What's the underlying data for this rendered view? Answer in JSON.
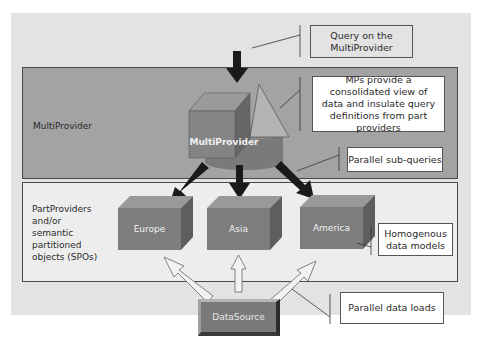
{
  "diagram": {
    "layers": {
      "multiprovider_layer_label": "MultiProvider",
      "partprovider_layer_label": "PartProviders\nand/or\nsemantic\npartitioned\nobjects (SPOs)"
    },
    "nodes": {
      "multiprovider": "MultiProvider",
      "partproviders": [
        "Europe",
        "Asia",
        "America"
      ],
      "datasource": "DataSource"
    },
    "callouts": {
      "query": "Query on the MultiProvider",
      "consolidated": "MPs provide a consolidated view of data and insulate query definitions from part providers",
      "subqueries": "Parallel sub-queries",
      "homogenous": "Homogenous data models",
      "dataloads": "Parallel data loads"
    },
    "colors": {
      "outer_bg": "#e3e3e3",
      "multiprovider_band": "#a3a3a3",
      "partprovider_band": "#ededed",
      "cube_front": "#7d7d7d",
      "cube_top": "#999999",
      "cube_side": "#5e5e5e",
      "arrow_dark": "#1a1a1a",
      "arrow_light": "#f2f2f2"
    }
  }
}
